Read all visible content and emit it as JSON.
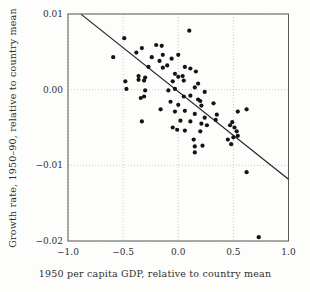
{
  "figure": {
    "background": "#fdfdfc"
  },
  "chart_data": {
    "type": "scatter",
    "title": "",
    "xlabel": "1950 per capita GDP, relative to country mean",
    "ylabel": "Growth rate, 1950–90, relative to country mean",
    "xlim": [
      -1.0,
      1.0
    ],
    "ylim": [
      -0.02,
      0.01
    ],
    "xticks": [
      -1.0,
      -0.5,
      0.0,
      0.5,
      1.0
    ],
    "yticks": [
      0.01,
      0.0,
      -0.01,
      -0.02
    ],
    "xtick_labels": [
      "−1.0",
      "−0.5",
      "0.0",
      "0.5",
      "1.0"
    ],
    "ytick_labels": [
      "0.01",
      "0.00",
      "−0.01",
      "−0.02"
    ],
    "grid": "dotted",
    "legend": "none",
    "regression_line": {
      "x1": -0.88,
      "y1": 0.00995,
      "x2": 1.0,
      "y2": -0.01185
    },
    "points": [
      [
        -0.59,
        0.0043
      ],
      [
        -0.49,
        0.0068
      ],
      [
        -0.38,
        0.0049
      ],
      [
        -0.33,
        0.0055
      ],
      [
        -0.24,
        0.0043
      ],
      [
        -0.2,
        0.0059
      ],
      [
        -0.15,
        0.0058
      ],
      [
        -0.14,
        0.0046
      ],
      [
        -0.17,
        0.0038
      ],
      [
        -0.27,
        0.003
      ],
      [
        -0.14,
        0.0029
      ],
      [
        -0.36,
        0.0018
      ],
      [
        -0.3,
        0.0016
      ],
      [
        0.1,
        0.0078
      ],
      [
        0.0,
        0.0046
      ],
      [
        -0.06,
        0.0041
      ],
      [
        -0.1,
        0.0032
      ],
      [
        0.06,
        0.003
      ],
      [
        0.11,
        0.0028
      ],
      [
        0.16,
        0.0024
      ],
      [
        -0.03,
        0.0021
      ],
      [
        0.04,
        0.0018
      ],
      [
        0.0,
        0.0017
      ],
      [
        -0.48,
        0.0011
      ],
      [
        -0.36,
        0.0013
      ],
      [
        -0.31,
        0.0012
      ],
      [
        -0.47,
        0.0001
      ],
      [
        -0.3,
        -0.0001
      ],
      [
        -0.34,
        -0.0011
      ],
      [
        -0.31,
        -0.0009
      ],
      [
        -0.16,
        -0.0026
      ],
      [
        -0.33,
        -0.0042
      ],
      [
        -0.01,
        -0.0053
      ],
      [
        -0.05,
        0.0011
      ],
      [
        0.05,
        0.0012
      ],
      [
        0.18,
        0.0008
      ],
      [
        -0.09,
        -0.0001
      ],
      [
        -0.03,
        0.0001
      ],
      [
        0.15,
        0.0003
      ],
      [
        0.24,
        -0.0003
      ],
      [
        0.05,
        -0.0009
      ],
      [
        0.11,
        -0.0008
      ],
      [
        0.18,
        -0.0013
      ],
      [
        -0.07,
        -0.0016
      ],
      [
        0.0,
        -0.002
      ],
      [
        0.32,
        -0.0018
      ],
      [
        0.06,
        -0.0028
      ],
      [
        -0.03,
        -0.0029
      ],
      [
        0.15,
        -0.0032
      ],
      [
        0.24,
        -0.0037
      ],
      [
        0.02,
        -0.0041
      ],
      [
        0.11,
        -0.0042
      ],
      [
        -0.05,
        -0.005
      ],
      [
        0.06,
        -0.0054
      ],
      [
        0.2,
        -0.0055
      ],
      [
        0.35,
        -0.0033
      ],
      [
        0.34,
        -0.004
      ],
      [
        0.2,
        -0.0015
      ],
      [
        0.21,
        -0.0021
      ],
      [
        0.21,
        -0.0045
      ],
      [
        0.26,
        -0.0047
      ],
      [
        0.47,
        -0.0047
      ],
      [
        0.51,
        -0.005
      ],
      [
        0.54,
        -0.0061
      ],
      [
        0.45,
        -0.0066
      ],
      [
        0.48,
        -0.0072
      ],
      [
        0.54,
        -0.0029
      ],
      [
        0.62,
        -0.0026
      ],
      [
        0.49,
        -0.0043
      ],
      [
        0.53,
        -0.0055
      ],
      [
        0.5,
        -0.0063
      ],
      [
        0.14,
        -0.0066
      ],
      [
        0.15,
        -0.0075
      ],
      [
        0.22,
        -0.0074
      ],
      [
        0.15,
        -0.0083
      ],
      [
        0.62,
        -0.0109
      ],
      [
        0.73,
        -0.0195
      ]
    ],
    "colors": {
      "point": "#141414",
      "line": "#222222",
      "grid": "#bdbdb8",
      "frame": "#5a5a58",
      "text": "#2f2f2f",
      "background": "#fdfdfc"
    }
  }
}
